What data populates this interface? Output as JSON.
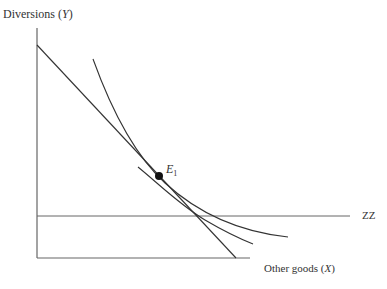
{
  "diagram": {
    "y_axis_label": "Diversions",
    "y_axis_var": "Y",
    "x_axis_label": "Other goods",
    "x_axis_var": "X",
    "zz_label": "ZZ",
    "point_label": "E",
    "point_subscript": "1",
    "elements": [
      "budget line",
      "indifference curve (upper)",
      "indifference curve (lower)",
      "ZZ horizontal line",
      "equilibrium point E1"
    ]
  }
}
